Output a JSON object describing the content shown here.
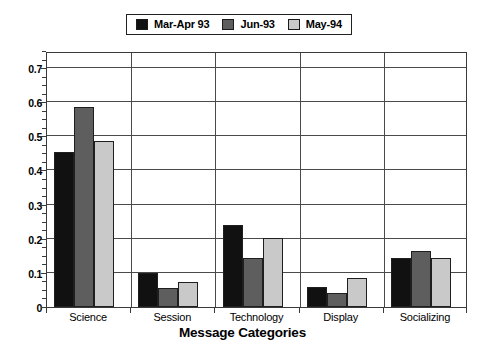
{
  "chart_data": {
    "type": "bar",
    "title": "",
    "xlabel": "Message Categories",
    "ylabel": "",
    "categories": [
      "Science",
      "Session",
      "Technology",
      "Display",
      "Socializing"
    ],
    "series": [
      {
        "name": "Mar-Apr 93",
        "color": "#111111",
        "values": [
          0.455,
          0.1,
          0.24,
          0.06,
          0.145
        ]
      },
      {
        "name": "Jun-93",
        "color": "#5e5e5e",
        "values": [
          0.585,
          0.055,
          0.145,
          0.042,
          0.163
        ]
      },
      {
        "name": "May-94",
        "color": "#c9c9c9",
        "values": [
          0.487,
          0.072,
          0.203,
          0.085,
          0.143
        ]
      }
    ],
    "ylim": [
      0,
      0.75
    ],
    "yticks": [
      "0",
      "0.1",
      "0.2",
      "0.3",
      "0.4",
      "0.5",
      "0.6",
      "0.7"
    ],
    "ytick_values": [
      0,
      0.1,
      0.2,
      0.3,
      0.4,
      0.5,
      0.6,
      0.7
    ],
    "grid": true,
    "legend_position": "top-center"
  },
  "legend": {
    "entries": [
      {
        "label": "Mar-Apr 93"
      },
      {
        "label": "Jun-93"
      },
      {
        "label": "May-94"
      }
    ]
  }
}
